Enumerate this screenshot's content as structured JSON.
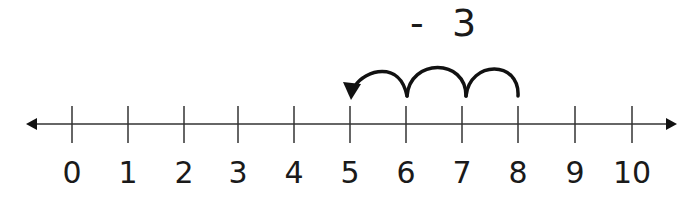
{
  "title": {
    "operator": "-",
    "value": "3"
  },
  "number_line": {
    "min": 0,
    "max": 10,
    "ticks": [
      "0",
      "1",
      "2",
      "3",
      "4",
      "5",
      "6",
      "7",
      "8",
      "9",
      "10"
    ],
    "tick_x": [
      72,
      128,
      184,
      238,
      294,
      350,
      406,
      462,
      518,
      575,
      632
    ],
    "axis_y": 124,
    "left_arrow_x": 28,
    "right_arrow_x": 676
  },
  "jumps": {
    "start": 8,
    "end": 5,
    "count": 3,
    "direction": "left"
  },
  "colors": {
    "ink": "#1a1a1a",
    "axis": "#333333",
    "background": "#ffffff"
  }
}
